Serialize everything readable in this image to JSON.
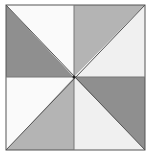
{
  "diagram": {
    "type": "pinwheel-square",
    "square": {
      "x": 6,
      "y": 5,
      "width": 139,
      "height": 145
    },
    "center": {
      "x": 74,
      "y": 77
    },
    "colors": {
      "dark": "#8f8f8f",
      "medium": "#b4b4b4",
      "light": "#f0f0f0",
      "white": "#fafafa",
      "stroke": "#555555"
    },
    "regions": [
      {
        "quadrant": "top-left",
        "triangle": "lower-left",
        "fill": "dark"
      },
      {
        "quadrant": "top-left",
        "triangle": "upper-right",
        "fill": "white"
      },
      {
        "quadrant": "top-right",
        "triangle": "upper-left",
        "fill": "medium"
      },
      {
        "quadrant": "top-right",
        "triangle": "lower-right",
        "fill": "light"
      },
      {
        "quadrant": "bottom-right",
        "triangle": "upper-right",
        "fill": "dark"
      },
      {
        "quadrant": "bottom-right",
        "triangle": "lower-left",
        "fill": "light"
      },
      {
        "quadrant": "bottom-left",
        "triangle": "lower-right",
        "fill": "medium"
      },
      {
        "quadrant": "bottom-left",
        "triangle": "upper-left",
        "fill": "white"
      }
    ]
  }
}
